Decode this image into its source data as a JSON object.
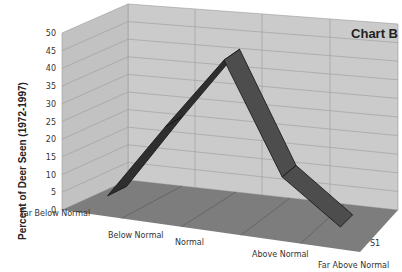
{
  "chart_data": {
    "type": "area",
    "subtype": "3d-ribbon-line",
    "title": "Chart B",
    "xlabel": "",
    "ylabel": "Percent of Deer Seen (1972-1997)",
    "ylim": [
      0,
      50
    ],
    "yticks": [
      "0",
      "5",
      "10",
      "15",
      "20",
      "25",
      "30",
      "35",
      "40",
      "45",
      "50"
    ],
    "categories": [
      "Far Below Normal",
      "Below Normal",
      "Normal",
      "Above Normal",
      "Far Above Normal"
    ],
    "series": [
      {
        "name": "S1",
        "values": [
          3,
          25,
          46,
          15,
          3
        ]
      }
    ],
    "depth_axis_label": "S1",
    "grid": true,
    "legend": "none"
  },
  "colors": {
    "wall": "#c8c8c8",
    "floor": "#7a7a7a",
    "ribbon_top": "#4a4a4a",
    "ribbon_face": "#2a2a2a",
    "grid": "#9a9a9a"
  }
}
